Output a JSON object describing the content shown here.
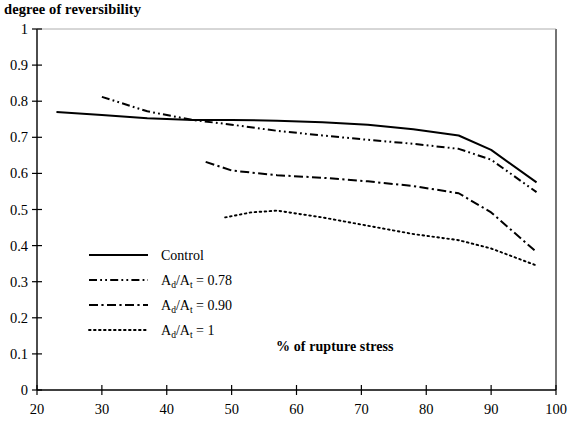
{
  "chart_data": {
    "type": "line",
    "title": "",
    "ylabel": "degree of reversibility",
    "xlabel": "% of rupture stress",
    "xlim": [
      20,
      100
    ],
    "ylim": [
      0,
      1
    ],
    "grid": false,
    "legend_position": "inside-left",
    "x_ticks": [
      "20",
      "30",
      "40",
      "50",
      "60",
      "70",
      "80",
      "90",
      "100"
    ],
    "y_ticks": [
      "0",
      "0.1",
      "0.2",
      "0.3",
      "0.4",
      "0.5",
      "0.6",
      "0.7",
      "0.8",
      "0.9",
      "1"
    ],
    "series": [
      {
        "name": "Control",
        "style": "solid",
        "x": [
          23,
          30,
          37,
          44,
          50,
          57,
          64,
          71,
          78,
          85,
          90,
          97
        ],
        "y": [
          0.77,
          0.762,
          0.753,
          0.748,
          0.748,
          0.746,
          0.742,
          0.735,
          0.722,
          0.705,
          0.665,
          0.575
        ]
      },
      {
        "name": "Ad/At = 0.78",
        "style": "dash-dot-dot",
        "x": [
          30,
          37,
          44,
          50,
          57,
          64,
          71,
          78,
          85,
          90,
          97
        ],
        "y": [
          0.812,
          0.772,
          0.748,
          0.735,
          0.718,
          0.705,
          0.693,
          0.682,
          0.668,
          0.638,
          0.548
        ]
      },
      {
        "name": "Ad/At = 0.90",
        "style": "dash-dot",
        "x": [
          46,
          50,
          57,
          64,
          71,
          78,
          85,
          90,
          97
        ],
        "y": [
          0.632,
          0.608,
          0.595,
          0.588,
          0.578,
          0.565,
          0.545,
          0.492,
          0.382
        ]
      },
      {
        "name": "Ad/At = 1",
        "style": "dotted",
        "x": [
          49,
          53,
          57,
          64,
          71,
          78,
          85,
          90,
          97
        ],
        "y": [
          0.478,
          0.492,
          0.497,
          0.478,
          0.455,
          0.432,
          0.415,
          0.392,
          0.345
        ]
      }
    ],
    "legend": [
      {
        "label": "Control",
        "base": "",
        "sub1": "",
        "mid": "",
        "sub2": "",
        "value": "",
        "style": "solid"
      },
      {
        "label": "",
        "base": "A",
        "sub1": "d",
        "mid": "/A",
        "sub2": "t",
        "value": " = 0.78",
        "style": "dash-dot-dot"
      },
      {
        "label": "",
        "base": "A",
        "sub1": "d",
        "mid": "/A",
        "sub2": "t",
        "value": " = 0.90",
        "style": "dash-dot"
      },
      {
        "label": "",
        "base": "A",
        "sub1": "d",
        "mid": "/A",
        "sub2": "t",
        "value": " = 1",
        "style": "dotted"
      }
    ],
    "colors": {
      "line": "#000000",
      "axis": "#000000",
      "background": "#ffffff"
    }
  }
}
